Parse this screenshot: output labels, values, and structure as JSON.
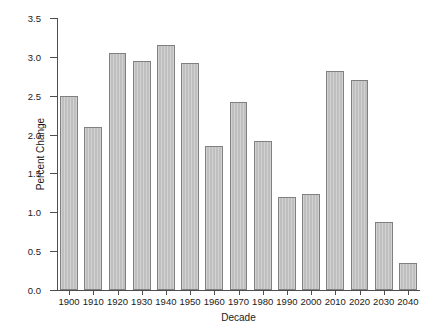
{
  "chart_data": {
    "type": "bar",
    "title": "",
    "xlabel": "Decade",
    "ylabel": "Percent Change",
    "categories": [
      "1900",
      "1910",
      "1920",
      "1930",
      "1940",
      "1950",
      "1960",
      "1970",
      "1980",
      "1990",
      "2000",
      "2010",
      "2020",
      "2030",
      "2040"
    ],
    "values": [
      2.5,
      2.1,
      3.05,
      2.95,
      3.15,
      2.92,
      1.85,
      2.42,
      1.92,
      1.2,
      1.23,
      2.82,
      2.7,
      0.88,
      0.35
    ],
    "ylim": [
      0.0,
      3.5
    ],
    "ytick_labels": [
      "0.0",
      "0.5",
      "1.0",
      "1.5",
      "2.0",
      "2.5",
      "3.0",
      "3.5"
    ],
    "ytick_values": [
      0.0,
      0.5,
      1.0,
      1.5,
      2.0,
      2.5,
      3.0,
      3.5
    ],
    "grid": false,
    "legend": null,
    "bar_fill_color": "#bfbfbf",
    "bar_edge_color": "#808080",
    "axis_color": "#4d4d4d",
    "background_color": "#ffffff"
  }
}
